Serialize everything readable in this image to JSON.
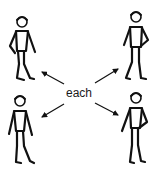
{
  "symbol": {
    "word": "each",
    "colors": {
      "ink": "#111111",
      "background": "#ffffff"
    },
    "figures": [
      {
        "position": "top-left",
        "pose": "hand-on-hip-left"
      },
      {
        "position": "top-right",
        "pose": "hand-on-hip-right"
      },
      {
        "position": "bottom-left",
        "pose": "arms-down"
      },
      {
        "position": "bottom-right",
        "pose": "hand-on-hip-right"
      }
    ],
    "arrows": [
      {
        "direction": "up-left",
        "target": "top-left"
      },
      {
        "direction": "up-right",
        "target": "top-right"
      },
      {
        "direction": "down-left",
        "target": "bottom-left"
      },
      {
        "direction": "down-right",
        "target": "bottom-right"
      }
    ]
  }
}
